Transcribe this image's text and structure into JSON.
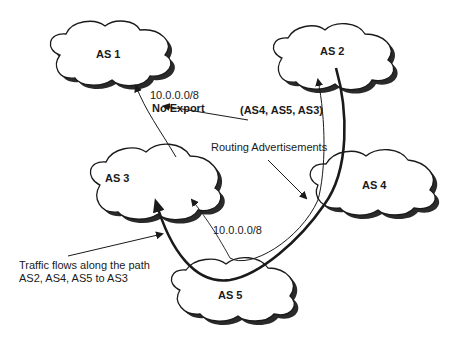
{
  "diagram": {
    "nodes": [
      {
        "id": "as1",
        "label": "AS 1"
      },
      {
        "id": "as2",
        "label": "AS 2"
      },
      {
        "id": "as3",
        "label": "AS 3"
      },
      {
        "id": "as4",
        "label": "AS 4"
      },
      {
        "id": "as5",
        "label": "AS 5"
      }
    ],
    "annotations": {
      "prefix_to_as1": "10.0.0.0/8",
      "no_export": "No Export",
      "as_path": "(AS4, AS5, AS3)",
      "routing_advertisements": "Routing Advertisements",
      "prefix_from_as3": "10.0.0.0/8",
      "traffic_line1": "Traffic flows along the path",
      "traffic_line2": "AS2, AS4, AS5 to AS3"
    },
    "edges": [
      {
        "from": "as3",
        "to": "as1",
        "type": "routing-advertisement",
        "label": "10.0.0.0/8 No Export"
      },
      {
        "from": "as3",
        "to": "as5",
        "type": "routing-advertisement",
        "label": "10.0.0.0/8"
      },
      {
        "from": "as5",
        "to": "as4",
        "type": "routing-advertisement"
      },
      {
        "from": "as4",
        "to": "as2",
        "type": "routing-advertisement",
        "label": "(AS4, AS5, AS3)"
      },
      {
        "from": "as2",
        "to": "as3",
        "type": "traffic-flow",
        "via": [
          "as4",
          "as5"
        ]
      }
    ],
    "colors": {
      "line": "#1a1a1a",
      "cloud_fill": "#ffffff",
      "cloud_shadow": "#2a2a2a"
    }
  }
}
